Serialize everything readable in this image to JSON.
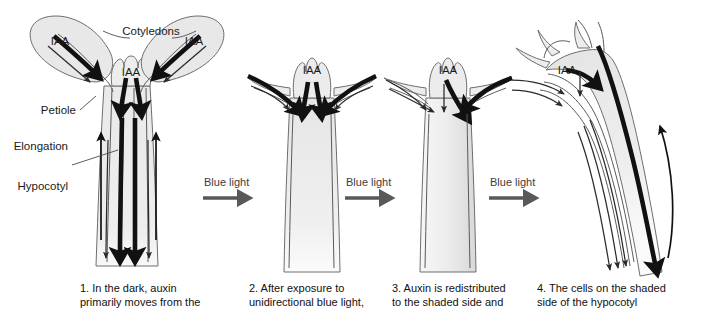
{
  "figure": {
    "background_color": "#ffffff",
    "organ_fill_color": "#ececec",
    "organ_outline_color": "#6e6e6e",
    "auxin_arrow_color": "#111111",
    "blue_light_arrow_color": "#595959",
    "text_color": "#1a1a1a"
  },
  "annotations": {
    "cotyledons": "Cotyledons",
    "petiole": "Petiole",
    "elongation": "Elongation",
    "hypocotyl": "Hypocotyl"
  },
  "auxin_labels": {
    "iaa": "IAA"
  },
  "blue_light": {
    "label": "Blue light"
  },
  "panels": [
    {
      "number": "1",
      "caption_line_1": "1. In the dark, auxin",
      "caption_line_2": "primarily moves from the",
      "state": "dark-upright"
    },
    {
      "number": "2",
      "caption_line_1": "2. After exposure to",
      "caption_line_2": "unidirectional blue light,",
      "state": "lit-upright"
    },
    {
      "number": "3",
      "caption_line_1": "3. Auxin is redistributed",
      "caption_line_2": "to the shaded side and",
      "state": "redistributed"
    },
    {
      "number": "4",
      "caption_line_1": "4. The cells on the shaded",
      "caption_line_2": "side of the hypocotyl",
      "state": "bending"
    }
  ]
}
